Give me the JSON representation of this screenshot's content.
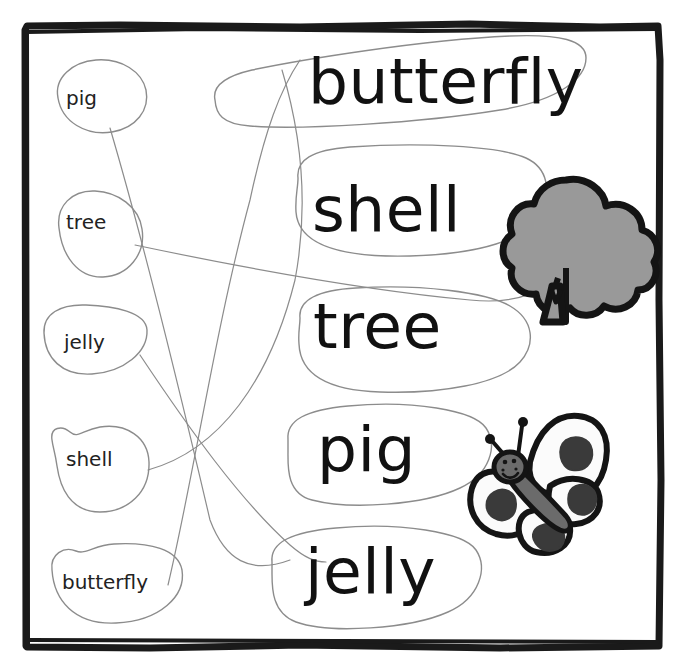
{
  "worksheet": {
    "type": "word-matching-exercise",
    "title_text": "",
    "frame": {
      "style": "hand-drawn-black-border",
      "color": "#1a1a1a"
    },
    "background_color": "#ffffff",
    "pencil_color": "#8c8c8c",
    "answer_pairs": [
      {
        "small": "pig",
        "big": "pig"
      },
      {
        "small": "tree",
        "big": "tree"
      },
      {
        "small": "jelly",
        "big": "jelly"
      },
      {
        "small": "shell",
        "big": "shell"
      },
      {
        "small": "butterfly",
        "big": "butterfly"
      }
    ]
  },
  "small_words": [
    {
      "label": "pig",
      "x": 66,
      "y": 88,
      "bubble_cx": 100,
      "bubble_cy": 101,
      "bubble_rx": 47,
      "bubble_ry": 36
    },
    {
      "label": "tree",
      "x": 66,
      "y": 212,
      "bubble_cx": 99,
      "bubble_cy": 233,
      "bubble_rx": 45,
      "bubble_ry": 41
    },
    {
      "label": "jelly",
      "x": 64,
      "y": 332,
      "bubble_cx": 95,
      "bubble_cy": 343,
      "bubble_rx": 52,
      "bubble_ry": 35
    },
    {
      "label": "shell",
      "x": 66,
      "y": 449,
      "bubble_cx": 100,
      "bubble_cy": 467,
      "bubble_rx": 50,
      "bubble_ry": 40
    },
    {
      "label": "butterfly",
      "x": 62,
      "y": 572,
      "bubble_cx": 110,
      "bubble_cy": 588,
      "bubble_rx": 72,
      "bubble_ry": 42
    }
  ],
  "big_words": [
    {
      "label": "butterfly",
      "x": 308,
      "y": 50,
      "font_size": 63
    },
    {
      "label": "shell",
      "x": 312,
      "y": 178,
      "font_size": 63
    },
    {
      "label": "tree",
      "x": 313,
      "y": 295,
      "font_size": 63
    },
    {
      "label": "pig",
      "x": 317,
      "y": 418,
      "font_size": 63
    },
    {
      "label": "jelly",
      "x": 305,
      "y": 540,
      "font_size": 63
    }
  ],
  "illustrations": [
    {
      "name": "tree-illustration",
      "alt": "tree",
      "x": 505,
      "y": 178,
      "width": 135,
      "height": 145,
      "fill_color": "#999999",
      "outline_color": "#141414"
    },
    {
      "name": "butterfly-illustration",
      "alt": "butterfly",
      "x": 470,
      "y": 410,
      "width": 160,
      "height": 145,
      "body_color": "#6b6b6b",
      "wing_color": "#fbfbfb",
      "spot_color": "#3a3a3a",
      "outline_color": "#141414"
    }
  ],
  "colors": {
    "ink_black": "#111111",
    "frame_black": "#1a1a1a",
    "pencil_gray": "#8c8c8c",
    "tree_gray": "#999999",
    "butterfly_body_gray": "#6b6b6b",
    "butterfly_spot_gray": "#3a3a3a",
    "paper_white": "#ffffff"
  }
}
